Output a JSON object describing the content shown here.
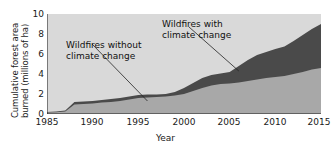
{
  "chart_data": {
    "type": "area",
    "title": "",
    "xlabel": "Year",
    "ylabel": "Cumulative forest area burned (millions of ha)",
    "ylabel_line1": "Cumulative forest area",
    "ylabel_line2": "burned (millions of ha)",
    "xlim": [
      1985,
      2015
    ],
    "ylim": [
      0,
      10
    ],
    "xticks": [
      1985,
      1990,
      1995,
      2000,
      2005,
      2010,
      2015
    ],
    "yticks": [
      0,
      2,
      4,
      6,
      8,
      10
    ],
    "grid": false,
    "stacked": true,
    "legend_position": "annotations-inline",
    "x": [
      1985,
      1986,
      1987,
      1988,
      1989,
      1990,
      1991,
      1992,
      1993,
      1994,
      1995,
      1996,
      1997,
      1998,
      1999,
      2000,
      2001,
      2002,
      2003,
      2004,
      2005,
      2006,
      2007,
      2008,
      2009,
      2010,
      2011,
      2012,
      2013,
      2014,
      2015
    ],
    "series": [
      {
        "name": "Wildfires without climate change",
        "color": "#a8a8a8",
        "values": [
          0.15,
          0.18,
          0.25,
          0.95,
          1.0,
          1.05,
          1.15,
          1.2,
          1.3,
          1.45,
          1.6,
          1.65,
          1.7,
          1.75,
          1.85,
          2.0,
          2.3,
          2.6,
          2.85,
          3.0,
          3.05,
          3.15,
          3.3,
          3.45,
          3.6,
          3.7,
          3.8,
          4.0,
          4.2,
          4.45,
          4.6
        ]
      },
      {
        "name": "Wildfires with climate change",
        "color": "#4a4a4a",
        "values": [
          0.2,
          0.24,
          0.35,
          1.2,
          1.25,
          1.3,
          1.4,
          1.5,
          1.6,
          1.75,
          1.9,
          1.95,
          1.95,
          2.0,
          2.2,
          2.6,
          3.1,
          3.6,
          3.9,
          4.05,
          4.2,
          4.8,
          5.4,
          5.9,
          6.2,
          6.5,
          6.75,
          7.3,
          7.9,
          8.5,
          9.0
        ]
      }
    ],
    "annotations": [
      {
        "id": "without",
        "line1": "Wildfires without",
        "line2": "climate change",
        "points_to_year": 1996,
        "points_to_value": 1.3
      },
      {
        "id": "with",
        "line1": "Wildfires with",
        "line2": "climate change",
        "points_to_year": 2006,
        "points_to_value": 4.3
      }
    ],
    "colors": {
      "plot_background": "#d9d9d9",
      "lower_band": "#a8a8a8",
      "upper_band": "#4a4a4a",
      "axis": "#1a1a1a",
      "text": "#1a1a1a"
    }
  }
}
